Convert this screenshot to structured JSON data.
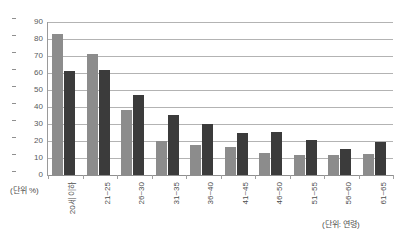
{
  "chart_data": {
    "type": "bar",
    "title": "",
    "subtitle": "",
    "xlabel": "(단위: 연령)",
    "ylabel": "(단위: %)",
    "ylim": [
      0,
      90
    ],
    "ytick_step": 10,
    "yticks": [
      90,
      80,
      70,
      60,
      50,
      40,
      30,
      20,
      10,
      0
    ],
    "grid": true,
    "legend": "none",
    "categories": [
      "20세 이하",
      "21~25",
      "26~30",
      "31~35",
      "36~40",
      "41~45",
      "46~50",
      "51~55",
      "56~60",
      "61~65"
    ],
    "series": [
      {
        "name": "series-1",
        "color": "#8c8c8c",
        "values": [
          83,
          71,
          38,
          20,
          17.5,
          16.5,
          13,
          11.5,
          12,
          12.5
        ]
      },
      {
        "name": "series-2",
        "color": "#3b3b3b",
        "values": [
          61,
          62,
          47,
          35.5,
          30,
          25,
          25.5,
          20.5,
          15.5,
          19.5
        ]
      }
    ]
  },
  "axis": {
    "y_unit_caption": "(단위 %)",
    "x_unit_caption": "(단위: 연령)"
  },
  "colors": {
    "series1": "#8c8c8c",
    "series2": "#3b3b3b",
    "gridline": "#b3b3b3",
    "axis": "#9a9a9a",
    "text": "#4d4d4d",
    "background": "#ffffff"
  }
}
